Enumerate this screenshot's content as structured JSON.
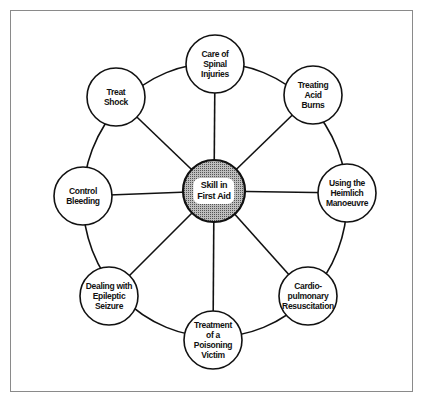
{
  "diagram": {
    "type": "hub-and-spoke",
    "center": {
      "label": "Skill in\nFirst Aid",
      "x": 214,
      "y": 191,
      "r": 31,
      "fill": "#9a9a9a"
    },
    "ring": {
      "cx": 215,
      "cy": 200,
      "rx": 132,
      "ry": 137
    },
    "node_radius": 29,
    "nodes": [
      {
        "id": "spinal",
        "label": "Care of\nSpinal\nInjuries",
        "x": 215,
        "y": 64
      },
      {
        "id": "acid",
        "label": "Treating\nAcid\nBurns",
        "x": 313,
        "y": 95
      },
      {
        "id": "heimlich",
        "label": "Using the\nHeimlich\nManoeuvre",
        "x": 347,
        "y": 193
      },
      {
        "id": "cpr",
        "label": "Cardio-\npulmonary\nResuscitation",
        "x": 308,
        "y": 296
      },
      {
        "id": "poison",
        "label": "Treatment\nof a\nPoisoning\nVictim",
        "x": 213,
        "y": 340
      },
      {
        "id": "epileptic",
        "label": "Dealing with\nEpileptic\nSeizure",
        "x": 109,
        "y": 296
      },
      {
        "id": "bleeding",
        "label": "Control\nBleeding",
        "x": 83,
        "y": 196
      },
      {
        "id": "shock",
        "label": "Treat\nShock",
        "x": 116,
        "y": 97
      }
    ],
    "colors": {
      "stroke": "#111111",
      "frame": "#8a8a8a",
      "background": "#ffffff"
    }
  }
}
